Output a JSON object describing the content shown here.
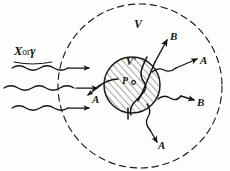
{
  "figure": {
    "background_color": "#fdfdfc",
    "ink_color": "#141414",
    "hatch_color": "#3a3a3a",
    "labels": {
      "incident_beam": "X or γ",
      "incident_beam_x": "X",
      "incident_beam_or": "or",
      "incident_beam_gamma": "γ",
      "outer_region": "V",
      "inner_region": "V'",
      "point_marker": "P",
      "ray_backscatter_a": "A",
      "ray_forward_upper_b": "B",
      "ray_forward_a": "A",
      "ray_lower_b": "B",
      "ray_downward_a": "A"
    },
    "geometry": {
      "outer_circle": {
        "cx": 140,
        "cy": 86,
        "r": 82,
        "style": "dashed"
      },
      "inner_circle": {
        "cx": 132,
        "cy": 85,
        "r": 28,
        "style": "hatched"
      },
      "incident_wave_count": 3,
      "outgoing_ray_count": 5
    }
  }
}
